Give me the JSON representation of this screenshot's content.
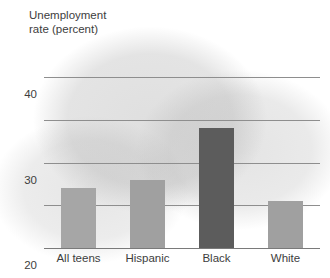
{
  "chart_data": {
    "type": "bar",
    "title_line1": "Unemployment",
    "title_line2": "rate (percent)",
    "xlabel": "",
    "ylabel": "Unemployment rate (percent)",
    "categories": [
      "All teens",
      "Hispanic",
      "Black",
      "White"
    ],
    "values": [
      14,
      16,
      28,
      11
    ],
    "ylim": [
      0,
      44
    ],
    "yticks": [
      0,
      10,
      20,
      30,
      40
    ],
    "ytick_labels": [
      "0",
      "10",
      "20",
      "30",
      "40"
    ],
    "grid": true,
    "legend": "none",
    "bar_colors": [
      "#a6a6a6",
      "#a0a0a0",
      "#5c5c5c",
      "#a0a0a0"
    ],
    "highlight_category": "Black",
    "series": [
      {
        "name": "Unemployment rate",
        "values": [
          14,
          16,
          28,
          11
        ]
      }
    ]
  },
  "style": {
    "grid_color": "#8e8e8e",
    "axis_color": "#7a7a7a",
    "text_color": "#3d3d3d",
    "background": "#ffffff",
    "bar_light": "#a6a6a6",
    "bar_dark": "#5c5c5c"
  }
}
